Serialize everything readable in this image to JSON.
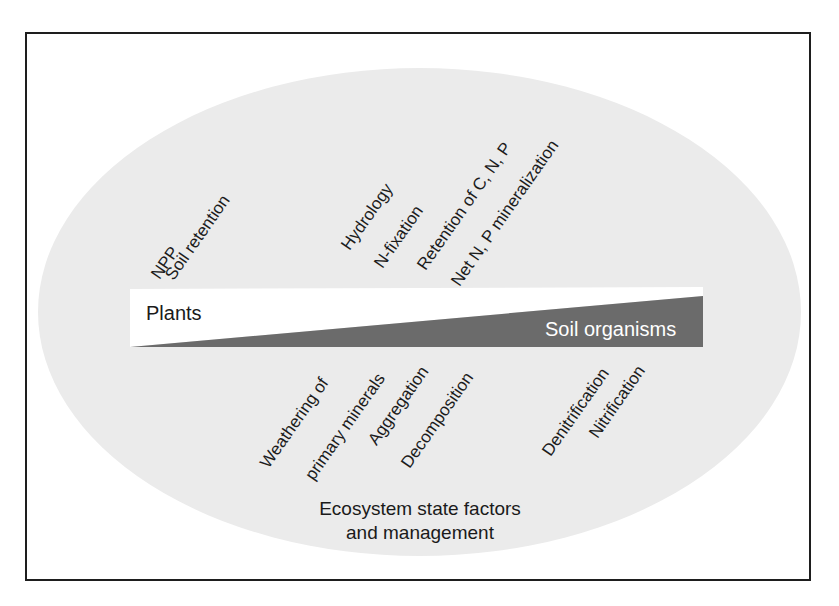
{
  "diagram": {
    "title": "",
    "bar": {
      "left_label": "Plants",
      "right_label": "Soil organisms",
      "colors": {
        "plants": "#ffffff",
        "soil_organisms": "#6b6b6b",
        "background": "#ebebeb",
        "frame": "#1e1e1e"
      }
    },
    "top_labels": [
      {
        "text": "NPP"
      },
      {
        "text": "Soil retention"
      },
      {
        "text": "Hydrology"
      },
      {
        "text": "N-fixation"
      },
      {
        "text": "Retention of C, N, P"
      },
      {
        "text": "Net N, P mineralization"
      }
    ],
    "bottom_labels": [
      {
        "text": "Weathering of"
      },
      {
        "text": "primary minerals"
      },
      {
        "text": "Aggregation"
      },
      {
        "text": "Decomposition"
      },
      {
        "text": "Denitrification"
      },
      {
        "text": "Nitrification"
      }
    ],
    "footer": {
      "line1": "Ecosystem state factors",
      "line2": "and management"
    }
  }
}
